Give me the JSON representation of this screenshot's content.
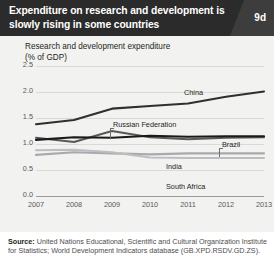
{
  "header": {
    "title": "Expenditure on research and development is slowly rising in some countries",
    "badge": "9d"
  },
  "chart_data": {
    "type": "line",
    "title": "Research and development expenditure",
    "subtitle": "(% of GDP)",
    "xlabel": "",
    "ylabel": "% of GDP",
    "x": [
      2007,
      2008,
      2009,
      2010,
      2011,
      2012,
      2013
    ],
    "xtick_labels": [
      "2007",
      "2008",
      "2009",
      "2010",
      "2011",
      "2012",
      "2013"
    ],
    "ytick_labels": [
      "2.5",
      "2.0",
      "1.5",
      "1.0",
      "0.5",
      "0.0"
    ],
    "ytick_values": [
      2.5,
      2.0,
      1.5,
      1.0,
      0.5,
      0.0
    ],
    "ylim": [
      0.0,
      2.5
    ],
    "grid": true,
    "legend_position": "inline-labels",
    "series": [
      {
        "name": "China",
        "label": "China",
        "color": "#2f2f2f",
        "values": [
          1.38,
          1.46,
          1.68,
          1.73,
          1.78,
          1.91,
          2.01
        ]
      },
      {
        "name": "Russian Federation",
        "label": "Russian Federation",
        "color": "#58595b",
        "values": [
          1.12,
          1.04,
          1.25,
          1.13,
          1.09,
          1.12,
          1.13
        ]
      },
      {
        "name": "Brazil",
        "label": "Brazil",
        "color": "#1a1a1a",
        "values": [
          1.08,
          1.13,
          1.12,
          1.16,
          1.14,
          1.15,
          1.15
        ]
      },
      {
        "name": "India",
        "label": "India",
        "color": "#a7a9ac",
        "values": [
          0.79,
          0.84,
          0.82,
          0.8,
          0.82,
          0.82,
          0.82
        ]
      },
      {
        "name": "South Africa",
        "label": "South Africa",
        "color": "#bcbec0",
        "values": [
          0.88,
          0.89,
          0.84,
          0.74,
          0.73,
          0.73,
          0.73
        ]
      }
    ]
  },
  "source": {
    "label": "Source:",
    "text": " United Nations Educational, Scientific and Cultural Organization Institute for Statistics; World Development Indicators database (GB.XPD.RSDV.GD.ZS)."
  }
}
